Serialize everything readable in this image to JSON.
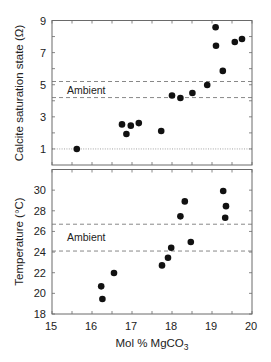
{
  "colors": {
    "background": "#ffffff",
    "axis": "#6a6a6a",
    "ambient_line": "#7a7a7a",
    "reference_line": "#9a9a9a",
    "point": "#111111",
    "text": "#222222"
  },
  "chart_data": [
    {
      "type": "scatter",
      "title": "",
      "xlabel": "",
      "shared_xlabel": {
        "text": "Mol % MgCO",
        "subscript": "3"
      },
      "ylabel": "Calcite saturation state (Ω)",
      "xlim": [
        15,
        20
      ],
      "ylim": [
        0,
        9
      ],
      "x_ticks": [
        15,
        15.5,
        16,
        16.5,
        17,
        17.5,
        18,
        18.5,
        19,
        19.5,
        20
      ],
      "x_tick_labels_shown": false,
      "y_ticks": [
        1,
        2,
        3,
        4,
        5,
        6,
        7,
        8,
        9
      ],
      "y_tick_labels": [
        {
          "value": 1,
          "label": "1"
        },
        {
          "value": 3,
          "label": "3"
        },
        {
          "value": 5,
          "label": "5"
        },
        {
          "value": 7,
          "label": "7"
        },
        {
          "value": 9,
          "label": "9"
        }
      ],
      "grid": false,
      "ambient": {
        "label": "Ambient",
        "range": [
          4.2,
          5.2
        ],
        "style": "dashed"
      },
      "reference_line": {
        "value": 1,
        "style": "dotted"
      },
      "points": [
        {
          "x": 15.62,
          "y": 1.0
        },
        {
          "x": 16.75,
          "y": 2.53
        },
        {
          "x": 16.86,
          "y": 1.93
        },
        {
          "x": 16.97,
          "y": 2.45
        },
        {
          "x": 17.17,
          "y": 2.61
        },
        {
          "x": 17.73,
          "y": 2.12
        },
        {
          "x": 18.0,
          "y": 4.33
        },
        {
          "x": 18.21,
          "y": 4.17
        },
        {
          "x": 18.51,
          "y": 4.48
        },
        {
          "x": 18.88,
          "y": 4.98
        },
        {
          "x": 19.09,
          "y": 8.58
        },
        {
          "x": 19.1,
          "y": 7.43
        },
        {
          "x": 19.27,
          "y": 5.86
        },
        {
          "x": 19.57,
          "y": 7.66
        },
        {
          "x": 19.75,
          "y": 7.85
        }
      ]
    },
    {
      "type": "scatter",
      "title": "",
      "xlabel": {
        "text": "Mol % MgCO",
        "subscript": "3"
      },
      "ylabel": "Temperature (°C)",
      "xlim": [
        15,
        20
      ],
      "ylim": [
        18,
        32
      ],
      "x_ticks": [
        15,
        15.5,
        16,
        16.5,
        17,
        17.5,
        18,
        18.5,
        19,
        19.5,
        20
      ],
      "x_tick_labels_shown": true,
      "x_tick_labels": [
        {
          "value": 15,
          "label": "15"
        },
        {
          "value": 16,
          "label": "16"
        },
        {
          "value": 17,
          "label": "17"
        },
        {
          "value": 18,
          "label": "18"
        },
        {
          "value": 19,
          "label": "19"
        },
        {
          "value": 20,
          "label": "20"
        }
      ],
      "y_ticks": [
        18,
        20,
        22,
        24,
        26,
        28,
        30
      ],
      "y_tick_labels": [
        {
          "value": 18,
          "label": "18"
        },
        {
          "value": 20,
          "label": "20"
        },
        {
          "value": 22,
          "label": "22"
        },
        {
          "value": 24,
          "label": "24"
        },
        {
          "value": 26,
          "label": "26"
        },
        {
          "value": 28,
          "label": "28"
        },
        {
          "value": 30,
          "label": "30"
        }
      ],
      "grid": false,
      "ambient": {
        "label": "Ambient",
        "range": [
          24.1,
          26.7
        ],
        "style": "dashed"
      },
      "points": [
        {
          "x": 16.23,
          "y": 20.68
        },
        {
          "x": 16.26,
          "y": 19.45
        },
        {
          "x": 16.55,
          "y": 21.97
        },
        {
          "x": 17.75,
          "y": 22.71
        },
        {
          "x": 17.9,
          "y": 23.45
        },
        {
          "x": 17.98,
          "y": 24.42
        },
        {
          "x": 18.21,
          "y": 27.46
        },
        {
          "x": 18.32,
          "y": 28.91
        },
        {
          "x": 18.47,
          "y": 24.97
        },
        {
          "x": 19.28,
          "y": 29.91
        },
        {
          "x": 19.35,
          "y": 28.45
        },
        {
          "x": 19.33,
          "y": 27.33
        }
      ]
    }
  ]
}
